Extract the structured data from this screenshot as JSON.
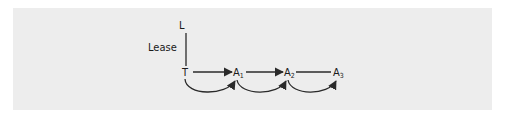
{
  "diagram": {
    "background_color": "#ededed",
    "line_color": "#2a2a2a",
    "nodes": [
      {
        "id": "L",
        "label": "L",
        "sub": ""
      },
      {
        "id": "T",
        "label": "T",
        "sub": ""
      },
      {
        "id": "A1",
        "label": "A",
        "sub": "1"
      },
      {
        "id": "A2",
        "label": "A",
        "sub": "2"
      },
      {
        "id": "A3",
        "label": "A",
        "sub": "3"
      }
    ],
    "edges": [
      {
        "from": "T",
        "to": "L",
        "type": "line",
        "label": "Lease"
      },
      {
        "from": "T",
        "to": "A1",
        "type": "straight-arrow"
      },
      {
        "from": "A1",
        "to": "A2",
        "type": "straight-arrow"
      },
      {
        "from": "A2",
        "to": "A3",
        "type": "line"
      },
      {
        "from": "T",
        "to": "A1",
        "type": "curved-arrow"
      },
      {
        "from": "A1",
        "to": "A2",
        "type": "curved-arrow"
      },
      {
        "from": "A2",
        "to": "A3",
        "type": "curved-arrow"
      }
    ],
    "edge_label_lease": "Lease"
  }
}
